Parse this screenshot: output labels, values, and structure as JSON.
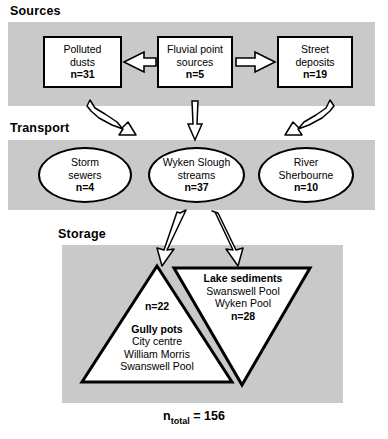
{
  "figure": {
    "sections": [
      {
        "id": "sources",
        "label": "Sources"
      },
      {
        "id": "transport",
        "label": "Transport"
      },
      {
        "id": "storage",
        "label": "Storage"
      }
    ],
    "sources": [
      {
        "name": "Polluted dusts",
        "line1": "Polluted",
        "line2": "dusts",
        "n_label": "n=31",
        "n": 31
      },
      {
        "name": "Fluvial point sources",
        "line1": "Fluvial point",
        "line2": "sources",
        "n_label": "n=5",
        "n": 5
      },
      {
        "name": "Street deposits",
        "line1": "Street",
        "line2": "deposits",
        "n_label": "n=19",
        "n": 19
      }
    ],
    "transport": [
      {
        "name": "Storm sewers",
        "line1": "Storm",
        "line2": "sewers",
        "n_label": "n=4",
        "n": 4
      },
      {
        "name": "Wyken Slough streams",
        "line1": "Wyken Slough",
        "line2": "streams",
        "n_label": "n=37",
        "n": 37
      },
      {
        "name": "River Sherbourne",
        "line1": "River",
        "line2": "Sherbourne",
        "n_label": "n=10",
        "n": 10
      }
    ],
    "storage": [
      {
        "name": "Gully pots",
        "title": "Gully pots",
        "n_label": "n=22",
        "n": 22,
        "sites": [
          "City centre",
          "William Morris",
          "Swanswell Pool"
        ]
      },
      {
        "name": "Lake sediments",
        "title": "Lake sediments",
        "n_label": "n=28",
        "n": 28,
        "sites": [
          "Swanswell Pool",
          "Wyken Pool"
        ]
      }
    ],
    "total": {
      "prefix": "n",
      "subscript": "total",
      "equals": "=",
      "value": "156"
    },
    "colors": {
      "band": "#c9c9c9",
      "outline": "#000000",
      "shape_fill": "#ffffff",
      "background": "#ffffff"
    }
  }
}
